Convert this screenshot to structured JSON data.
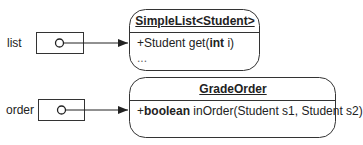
{
  "references": [
    {
      "name": "list",
      "target": "SimpleList<Student>"
    },
    {
      "name": "order",
      "target": "GradeOrder"
    }
  ],
  "classes": [
    {
      "name": "SimpleList<Student>",
      "members": [
        {
          "prefix": "+Student get(",
          "keyword": "int",
          "suffix": " i)"
        },
        {
          "text": "..."
        }
      ]
    },
    {
      "name": "GradeOrder",
      "members": [
        {
          "prefix": "+",
          "keyword": "boolean",
          "suffix": " inOrder(Student s1, Student s2)"
        }
      ]
    }
  ],
  "colors": {
    "stroke": "#333333",
    "background": "#ffffff"
  }
}
